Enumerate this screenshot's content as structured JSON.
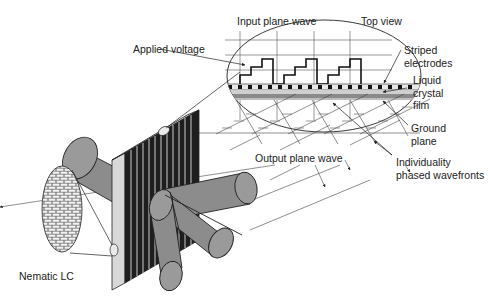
{
  "diagram": {
    "colors": {
      "background": "#ffffff",
      "ink": "#222222",
      "beam_fill": "#8c8c8c",
      "electrode_dark": "#1e1e1e",
      "glass_light": "#cfcfcf"
    },
    "labels": {
      "input_plane_wave": "Input plane wave",
      "top_view": "Top view",
      "applied_voltage": "Applied voltage",
      "striped_electrodes": "Striped\nelectrodes",
      "liquid_crystal_film": "Liquid\ncrystal\nfilm",
      "ground_plane": "Ground\nplane",
      "output_plane_wave": "Output plane wave",
      "phased_wavefronts": "Individuality\nphased wavefronts",
      "nematic_lc": "Nematic LC"
    },
    "components": [
      "top-view-inset",
      "staircase-voltage-profile",
      "striped-electrode-array",
      "liquid-crystal-layer",
      "ground-plane",
      "steered-beams",
      "nematic-lc-inset"
    ]
  }
}
